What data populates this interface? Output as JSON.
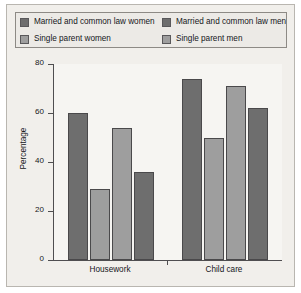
{
  "chart_data": {
    "type": "bar",
    "title": "",
    "xlabel": "",
    "ylabel": "Percentage",
    "categories": [
      "Housework",
      "Child care"
    ],
    "series": [
      {
        "name": "Married and common law women",
        "values": [
          60,
          74
        ],
        "color": "#6e6e6e"
      },
      {
        "name": "Single parent women",
        "values": [
          29,
          50
        ],
        "color": "#9e9e9e"
      },
      {
        "name": "Married and common law men",
        "values": [
          54,
          71
        ],
        "color": "#9e9e9e"
      },
      {
        "name": "Single parent men",
        "values": [
          36,
          62
        ],
        "color": "#6e6e6e"
      }
    ],
    "ylim": [
      0,
      80
    ],
    "yticks": [
      0,
      20,
      40,
      60,
      80
    ],
    "ytick_labels": [
      "0",
      "20",
      "40",
      "60",
      "80"
    ],
    "grid": true,
    "legend_position": "top"
  },
  "legend": {
    "items": [
      {
        "label": "Married and common law women",
        "color": "#6e6e6e"
      },
      {
        "label": "Married and common law men",
        "color": "#6e6e6e"
      },
      {
        "label": "Single parent women",
        "color": "#9e9e9e"
      },
      {
        "label": "Single parent men",
        "color": "#9e9e9e"
      }
    ]
  },
  "axis": {
    "y_title": "Percentage",
    "y_ticks": [
      "80",
      "60",
      "40",
      "20",
      "0"
    ],
    "x_categories": [
      "Housework",
      "Child care"
    ]
  },
  "colors": {
    "dark_bar": "#6e6e6e",
    "light_bar": "#9e9e9e",
    "figure_background": "#f1efeb",
    "plot_background": "#f6f5f2",
    "axis_line": "#4f4e50",
    "grid_line": "#e6e4df",
    "border": "#b9b6b0",
    "text": "#15161a"
  }
}
